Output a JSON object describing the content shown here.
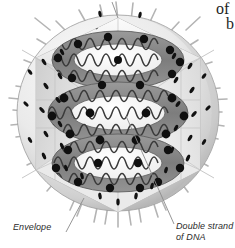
{
  "figure": {
    "background_color": "#ffffff",
    "width": 235,
    "height": 248
  },
  "labels": {
    "envelope": "Envelope",
    "dna_line1": "Double strand",
    "dna_line2": "of DNA"
  },
  "bleed_text": {
    "line1": "of",
    "line2": "b"
  },
  "colors": {
    "envelope_light": "#f2f2f2",
    "envelope_mid": "#d0d0d0",
    "envelope_dark": "#9d9d9d",
    "capsid_face_light": "#f7f7f7",
    "capsid_face_mid": "#e3e3e3",
    "capsid_face_dark": "#c6c6c6",
    "coil_band": "#8c8c8c",
    "coil_band_dark": "#6e6e6e",
    "dna_strand": "#3a3a3a",
    "capsomer": "#101010",
    "spike": "#bdbdbd",
    "leader_line": "#8a8a8a",
    "label_text": "#2a2a2a"
  },
  "structures": {
    "envelope": "outer lipid membrane sphere with radiating glycoprotein spikes",
    "capsid": "hexagonal icosahedral capsid, cut away, speckled with capsomers",
    "nucleocapsid": "three stacked toroidal coils containing zigzag double-stranded DNA"
  },
  "counts": {
    "dna_coils": 3
  }
}
